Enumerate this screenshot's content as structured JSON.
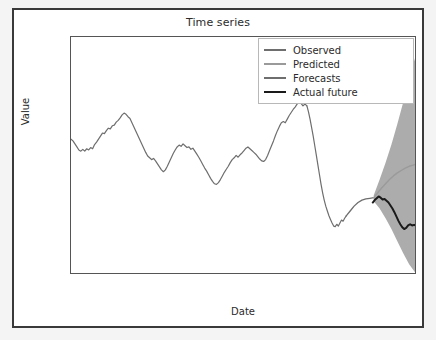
{
  "figure": {
    "title": "Time series",
    "background": "#ffffff",
    "frame_color": "#3a3a3a"
  },
  "axes": {
    "xlabel": "Date",
    "ylabel": "Value",
    "yticks": [
      75,
      50,
      25,
      0,
      -25,
      -50,
      -75,
      -100
    ],
    "ytick_labels": [
      "75",
      "50",
      "25",
      "0",
      "−25",
      "−50",
      "−75",
      "−100"
    ],
    "ylim": [
      -113,
      84
    ],
    "xtick_labels": [
      "Jan",
      "Feb",
      "Mar",
      "Apr",
      "May",
      "Jun",
      "Jul",
      "Aug",
      "Sep",
      "Oct",
      "Nov",
      "Dec",
      "Jan",
      "Feb"
    ],
    "xtick_years": [
      "2020",
      "",
      "",
      "",
      "",
      "",
      "",
      "",
      "",
      "",
      "",
      "",
      "2021",
      ""
    ],
    "grid": false
  },
  "legend": {
    "position": "upper right",
    "items": [
      {
        "label": "Observed",
        "color": "#6e6e6e",
        "width": 1.2
      },
      {
        "label": "Predicted",
        "color": "#9a9a9a",
        "width": 1.4
      },
      {
        "label": "Forecasts",
        "color": "#6e6e6e",
        "width": 1.3
      },
      {
        "label": "Actual future",
        "color": "#1a1a1a",
        "width": 2.0
      }
    ]
  },
  "chart_data": {
    "type": "line",
    "title": "Time series",
    "xlabel": "Date",
    "ylabel": "Value",
    "ylim": [
      -113,
      84
    ],
    "xlim": [
      0,
      13.6
    ],
    "grid": false,
    "legend_position": "upper right",
    "x_unit": "months since Jan 2020",
    "categories": [
      "Jan 2020",
      "Feb 2020",
      "Mar 2020",
      "Apr 2020",
      "May 2020",
      "Jun 2020",
      "Jul 2020",
      "Aug 2020",
      "Sep 2020",
      "Oct 2020",
      "Nov 2020",
      "Dec 2020",
      "Jan 2021",
      "Feb 2021"
    ],
    "forecast_start_x": 12.05,
    "series": [
      {
        "name": "Observed",
        "color": "#6e6e6e",
        "x": [
          0.0,
          0.1,
          0.2,
          0.3,
          0.4,
          0.5,
          0.6,
          0.7,
          0.8,
          0.9,
          1.0,
          1.1,
          1.2,
          1.3,
          1.4,
          1.5,
          1.6,
          1.7,
          1.8,
          1.9,
          2.0,
          2.1,
          2.2,
          2.3,
          2.4,
          2.5,
          2.6,
          2.7,
          2.8,
          2.9,
          3.0,
          3.1,
          3.2,
          3.3,
          3.4,
          3.5,
          3.6,
          3.7,
          3.8,
          3.9,
          4.0,
          4.1,
          4.2,
          4.3,
          4.4,
          4.5,
          4.6,
          4.7,
          4.8,
          4.9,
          5.0,
          5.1,
          5.2,
          5.3,
          5.4,
          5.5,
          5.6,
          5.7,
          5.8,
          5.9,
          6.0,
          6.1,
          6.2,
          6.3,
          6.4,
          6.5,
          6.6,
          6.7,
          6.8,
          6.9,
          7.0,
          7.1,
          7.2,
          7.3,
          7.4,
          7.5,
          7.6,
          7.7,
          7.8,
          7.9,
          8.0,
          8.1,
          8.2,
          8.3,
          8.4,
          8.5,
          8.6,
          8.7,
          8.8,
          8.9,
          9.0,
          9.1,
          9.2,
          9.3,
          9.4,
          9.5,
          9.6,
          9.7,
          9.8,
          9.9,
          10.0,
          10.1,
          10.2,
          10.3,
          10.4,
          10.5,
          10.6,
          10.7,
          10.8,
          10.9,
          11.0,
          11.1,
          11.2,
          11.3,
          11.4,
          11.5,
          11.6,
          11.7,
          11.8,
          11.9,
          12.0
        ],
        "values": [
          -0.5,
          -2.0,
          -4.5,
          -7.0,
          -9.5,
          -10.5,
          -9.0,
          -10.5,
          -8.5,
          -9.5,
          -7.5,
          -8.5,
          -5.0,
          -3.0,
          -0.5,
          2.0,
          4.5,
          4.0,
          6.5,
          8.5,
          8.0,
          10.5,
          11.0,
          13.5,
          15.0,
          17.0,
          19.5,
          21.0,
          20.0,
          18.0,
          16.5,
          13.0,
          9.5,
          6.0,
          2.5,
          -1.0,
          -4.5,
          -8.0,
          -11.5,
          -14.5,
          -16.0,
          -17.5,
          -16.5,
          -18.5,
          -21.0,
          -23.5,
          -26.0,
          -27.5,
          -26.0,
          -23.0,
          -19.5,
          -16.0,
          -12.5,
          -9.5,
          -7.0,
          -5.5,
          -6.5,
          -4.5,
          -6.0,
          -7.5,
          -7.0,
          -9.0,
          -8.0,
          -10.5,
          -13.0,
          -15.5,
          -18.5,
          -21.5,
          -24.5,
          -27.0,
          -30.0,
          -33.0,
          -35.5,
          -37.5,
          -38.0,
          -36.5,
          -34.0,
          -31.0,
          -28.0,
          -25.5,
          -23.0,
          -20.0,
          -17.5,
          -16.0,
          -14.0,
          -15.5,
          -13.5,
          -12.0,
          -10.0,
          -8.0,
          -7.0,
          -8.5,
          -10.0,
          -11.5,
          -13.0,
          -15.0,
          -17.0,
          -18.5,
          -19.0,
          -17.5,
          -14.0,
          -10.0,
          -6.0,
          -2.0,
          2.5,
          6.5,
          10.0,
          13.0,
          14.0,
          13.0,
          16.0,
          19.0,
          21.5,
          24.0,
          26.0,
          28.5,
          30.0,
          29.0,
          27.0,
          28.5,
          27.0
        ]
      },
      {
        "name": "Observed-tail",
        "color": "#6e6e6e",
        "x": [
          12.0,
          12.08,
          12.16,
          12.24,
          12.32,
          12.4,
          12.48,
          12.56,
          12.64,
          12.72,
          12.8,
          12.88,
          12.96,
          13.04,
          13.12,
          13.2,
          13.28,
          13.36,
          13.44,
          13.52,
          13.6,
          13.68,
          13.76,
          13.84,
          13.92,
          14.0
        ],
        "values": [
          27.0,
          22.0,
          16.0,
          9.0,
          2.0,
          -6.0,
          -14.0,
          -22.0,
          -30.0,
          -38.0,
          -45.0,
          -51.0,
          -56.0,
          -60.0,
          -64.0,
          -67.0,
          -70.0,
          -72.5,
          -73.0,
          -71.0,
          -72.5,
          -70.0,
          -67.5,
          -68.5,
          -66.0,
          -64.0
        ],
        "note": "steep Nov-Dec decline into the Dec trough near -73"
      },
      {
        "name": "Forecasts",
        "color": "#6e6e6e",
        "x": [
          14.0,
          14.2,
          14.4,
          14.6,
          14.8,
          15.0,
          15.2,
          15.4
        ],
        "values": [
          -64.0,
          -60.0,
          -56.0,
          -53.0,
          -51.0,
          -50.0,
          -49.5,
          -49.0
        ],
        "note": "in-sample fitted continuation joining the forecast origin"
      },
      {
        "name": "Predicted",
        "color": "#9a9a9a",
        "x": [
          15.4,
          15.6,
          15.8,
          16.0,
          16.2,
          16.4,
          16.6,
          16.8,
          17.0,
          17.2,
          17.4,
          17.6
        ],
        "values": [
          -49.0,
          -45.0,
          -41.0,
          -37.5,
          -34.0,
          -31.0,
          -28.5,
          -26.5,
          -24.5,
          -23.0,
          -22.0,
          -21.0
        ],
        "note": "forecast mean rising from about -49 to about -21 at the right edge"
      },
      {
        "name": "Actual future",
        "color": "#1a1a1a",
        "x": [
          15.35,
          15.45,
          15.55,
          15.65,
          15.75,
          15.85,
          15.95,
          16.05,
          16.15,
          16.25,
          16.35,
          16.45,
          16.55,
          16.65,
          16.75,
          16.85,
          16.95,
          17.05,
          17.15,
          17.25,
          17.35,
          17.45,
          17.55
        ],
        "values": [
          -53.0,
          -51.0,
          -49.5,
          -48.0,
          -49.0,
          -50.5,
          -50.0,
          -51.5,
          -53.0,
          -55.5,
          -58.0,
          -61.0,
          -64.5,
          -68.0,
          -71.0,
          -73.5,
          -75.0,
          -74.0,
          -72.0,
          -71.0,
          -72.0,
          -71.5,
          -72.0
        ],
        "note": "black observed-future line peaking near -48 then falling to about -72"
      }
    ],
    "confidence_band": {
      "name": "Forecast interval",
      "color": "#9e9e9e",
      "opacity": 0.85,
      "x": [
        15.4,
        15.7,
        16.0,
        16.3,
        16.6,
        16.9,
        17.2,
        17.6
      ],
      "lower": [
        -52.0,
        -58.0,
        -66.0,
        -75.0,
        -85.0,
        -95.0,
        -104.0,
        -113.0
      ],
      "upper": [
        -47.0,
        -34.0,
        -20.0,
        -5.0,
        12.0,
        30.0,
        50.0,
        72.0
      ],
      "note": "fan-shaped prediction interval widening to the right edge"
    }
  }
}
